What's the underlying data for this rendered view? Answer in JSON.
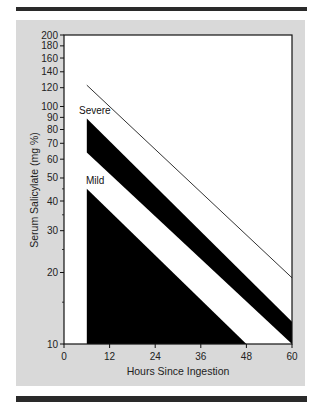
{
  "chart_data": {
    "type": "line",
    "title": "",
    "xlabel": "Hours Since Ingestion",
    "ylabel": "Serum Salicylate (mg %)",
    "x_scale": "linear",
    "y_scale": "log",
    "xlim": [
      0,
      60
    ],
    "ylim": [
      10,
      200
    ],
    "x_ticks": [
      0,
      12,
      24,
      36,
      48,
      60
    ],
    "y_ticks": [
      200,
      180,
      160,
      140,
      120,
      100,
      90,
      80,
      70,
      60,
      50,
      40,
      30,
      20,
      10
    ],
    "grid": false,
    "legend": null,
    "series": [
      {
        "name": "Upper reference line",
        "style": "thin line",
        "x": [
          6,
          60
        ],
        "y": [
          123,
          19
        ]
      },
      {
        "name": "Severe band top",
        "style": "filled black band upper edge",
        "x": [
          6,
          60
        ],
        "y": [
          89,
          12.4
        ]
      },
      {
        "name": "Severe band bottom",
        "style": "filled black band lower edge",
        "x": [
          6,
          60
        ],
        "y": [
          64,
          10
        ]
      },
      {
        "name": "Mild region top",
        "style": "filled black region upper edge",
        "x": [
          6,
          48
        ],
        "y": [
          45,
          10
        ]
      }
    ],
    "annotations": [
      {
        "text": "Severe",
        "x": 6,
        "y": 100
      },
      {
        "text": "Mild",
        "x": 6,
        "y": 52
      }
    ]
  },
  "labels": {
    "x_title": "Hours Since Ingestion",
    "y_title": "Serum Salicylate (mg %)",
    "severe": "Severe",
    "mild": "Mild",
    "x_ticks": [
      "0",
      "12",
      "24",
      "36",
      "48",
      "60"
    ],
    "y_ticks": [
      "200",
      "180",
      "160",
      "140",
      "120",
      "100",
      "90",
      "80",
      "70",
      "60",
      "50",
      "40",
      "30",
      "20",
      "10"
    ]
  }
}
